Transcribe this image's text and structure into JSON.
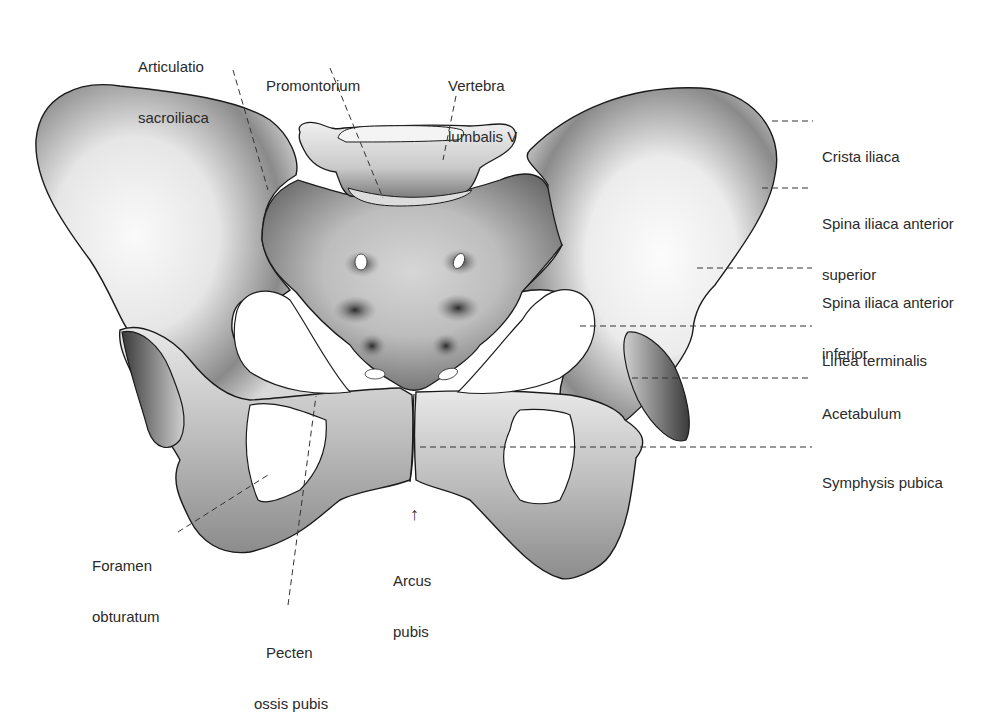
{
  "diagram": {
    "stroke_color": "#1a1a1a",
    "bone_light": "#f4f4f4",
    "bone_shadow": "#4a4a4a",
    "leader_color": "#333333"
  },
  "labels": {
    "articulatio_sacroiliaca": {
      "line1": "Articulatio",
      "line2": "sacroiliaca"
    },
    "promontorium": {
      "line1": "Promontorium"
    },
    "vertebra_lumbalis_v": {
      "line1": "Vertebra",
      "line2": "lumbalis V"
    },
    "crista_iliaca": {
      "line1": "Crista iliaca"
    },
    "spina_iliaca_anterior_superior": {
      "line1": "Spina iliaca anterior",
      "line2": "superior"
    },
    "spina_iliaca_anterior_inferior": {
      "line1": "Spina iliaca anterior",
      "line2": "inferior"
    },
    "linea_terminalis": {
      "line1": "Linea terminalis"
    },
    "acetabulum": {
      "line1": "Acetabulum"
    },
    "symphysis_pubica": {
      "line1": "Symphysis pubica"
    },
    "foramen_obturatum": {
      "line1": "Foramen",
      "line2": "obturatum"
    },
    "pecten_ossis_pubis": {
      "line1": "Pecten",
      "line2": "ossis pubis"
    },
    "arcus_pubis": {
      "line1": "Arcus",
      "line2": "pubis",
      "arrow": "↑"
    }
  }
}
